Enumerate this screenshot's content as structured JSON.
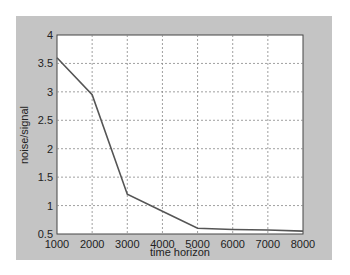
{
  "chart_data": {
    "type": "line",
    "title": "",
    "xlabel": "time horizon",
    "ylabel": "noise/signal",
    "x": [
      1000,
      2000,
      3000,
      4000,
      5000,
      6000,
      7000,
      8000
    ],
    "series": [
      {
        "name": "noise/signal",
        "values": [
          3.6,
          2.95,
          1.2,
          0.9,
          0.6,
          0.58,
          0.57,
          0.55
        ],
        "color": "#555555"
      }
    ],
    "xlim": [
      1000,
      8000
    ],
    "ylim": [
      0.5,
      4
    ],
    "xticks": [
      "1000",
      "2000",
      "3000",
      "4000",
      "5000",
      "6000",
      "7000",
      "8000"
    ],
    "yticks": [
      "0.5",
      "1",
      "1.5",
      "2",
      "2.5",
      "3",
      "3.5",
      "4"
    ],
    "grid": true,
    "legend": null
  },
  "colors": {
    "panel": "#c4c4c4",
    "plot_bg": "#ffffff",
    "line": "#555555",
    "grid": "#888888"
  }
}
